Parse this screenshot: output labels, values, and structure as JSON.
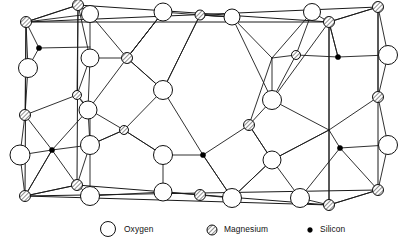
{
  "figure": {
    "background_color": "#ffffff",
    "line_color": "#1a1a1a"
  },
  "legend": {
    "items": [
      {
        "key": "oxygen",
        "label": "Oxygen",
        "symbol": "open-circle",
        "radius": 7.5,
        "fill": "#ffffff",
        "stroke": "#111111",
        "cx": 108,
        "cy": 229,
        "label_x": 124,
        "label_y": 232
      },
      {
        "key": "magnesium",
        "label": "Magnesium",
        "symbol": "hatched-circle",
        "radius": 5.0,
        "fill": "hatch",
        "stroke": "#111111",
        "cx": 212,
        "cy": 230,
        "label_x": 224,
        "label_y": 232
      },
      {
        "key": "silicon",
        "label": "Silicon",
        "symbol": "filled-dot",
        "radius": 2.4,
        "fill": "#000000",
        "stroke": "#000000",
        "cx": 310,
        "cy": 230,
        "label_x": 320,
        "label_y": 232
      }
    ]
  },
  "structure": {
    "cell_edges": [
      [
        26,
        22,
        78,
        5
      ],
      [
        78,
        5,
        329,
        22
      ],
      [
        329,
        22,
        378,
        7
      ],
      [
        26,
        22,
        25,
        196
      ],
      [
        78,
        5,
        77,
        185
      ],
      [
        329,
        22,
        329,
        205
      ],
      [
        378,
        7,
        378,
        190
      ],
      [
        25,
        196,
        77,
        185
      ],
      [
        77,
        185,
        329,
        205
      ],
      [
        329,
        205,
        378,
        190
      ],
      [
        26,
        22,
        378,
        7
      ],
      [
        25,
        196,
        378,
        190
      ],
      [
        26,
        22,
        329,
        22
      ],
      [
        25,
        196,
        329,
        205
      ]
    ],
    "bonds": [
      [
        26,
        22,
        90,
        14
      ],
      [
        78,
        5,
        90,
        14
      ],
      [
        26,
        22,
        78,
        5
      ],
      [
        90,
        14,
        127,
        58
      ],
      [
        90,
        14,
        90,
        58
      ],
      [
        26,
        22,
        39,
        48
      ],
      [
        39,
        48,
        90,
        47
      ],
      [
        39,
        48,
        28,
        68
      ],
      [
        28,
        68,
        26,
        22
      ],
      [
        28,
        68,
        25,
        115
      ],
      [
        26,
        22,
        25,
        115
      ],
      [
        25,
        115,
        52,
        150
      ],
      [
        52,
        150,
        25,
        196
      ],
      [
        25,
        115,
        20,
        155
      ],
      [
        20,
        155,
        25,
        196
      ],
      [
        77,
        95,
        25,
        115
      ],
      [
        77,
        95,
        88,
        110
      ],
      [
        78,
        5,
        77,
        95
      ],
      [
        77,
        95,
        90,
        58
      ],
      [
        90,
        58,
        127,
        58
      ],
      [
        90,
        58,
        88,
        110
      ],
      [
        88,
        110,
        127,
        58
      ],
      [
        88,
        110,
        90,
        145
      ],
      [
        127,
        58,
        163,
        12
      ],
      [
        127,
        58,
        163,
        90
      ],
      [
        163,
        12,
        200,
        15
      ],
      [
        163,
        12,
        127,
        58
      ],
      [
        200,
        15,
        232,
        17
      ],
      [
        200,
        15,
        163,
        90
      ],
      [
        232,
        17,
        272,
        58
      ],
      [
        232,
        17,
        200,
        15
      ],
      [
        272,
        58,
        312,
        12
      ],
      [
        272,
        58,
        296,
        55
      ],
      [
        296,
        55,
        312,
        12
      ],
      [
        296,
        55,
        338,
        57
      ],
      [
        312,
        12,
        329,
        22
      ],
      [
        329,
        22,
        338,
        57
      ],
      [
        338,
        57,
        388,
        55
      ],
      [
        388,
        55,
        378,
        7
      ],
      [
        388,
        55,
        378,
        97
      ],
      [
        329,
        22,
        378,
        7
      ],
      [
        163,
        90,
        200,
        15
      ],
      [
        163,
        90,
        127,
        58
      ],
      [
        163,
        90,
        203,
        155
      ],
      [
        163,
        90,
        124,
        130
      ],
      [
        272,
        58,
        272,
        100
      ],
      [
        272,
        100,
        329,
        22
      ],
      [
        272,
        100,
        249,
        125
      ],
      [
        249,
        125,
        272,
        58
      ],
      [
        272,
        100,
        329,
        130
      ],
      [
        329,
        130,
        378,
        97
      ],
      [
        329,
        130,
        329,
        22
      ],
      [
        378,
        97,
        378,
        7
      ],
      [
        90,
        145,
        124,
        130
      ],
      [
        124,
        130,
        90,
        110
      ],
      [
        90,
        145,
        77,
        185
      ],
      [
        90,
        145,
        90,
        196
      ],
      [
        124,
        130,
        163,
        155
      ],
      [
        163,
        155,
        203,
        155
      ],
      [
        203,
        155,
        249,
        125
      ],
      [
        203,
        155,
        232,
        198
      ],
      [
        249,
        125,
        272,
        160
      ],
      [
        272,
        160,
        249,
        125
      ],
      [
        272,
        160,
        300,
        198
      ],
      [
        272,
        160,
        329,
        130
      ],
      [
        329,
        130,
        329,
        205
      ],
      [
        329,
        130,
        272,
        160
      ],
      [
        90,
        196,
        77,
        185
      ],
      [
        77,
        185,
        25,
        196
      ],
      [
        90,
        196,
        163,
        192
      ],
      [
        163,
        192,
        200,
        195
      ],
      [
        200,
        195,
        232,
        198
      ],
      [
        232,
        198,
        272,
        160
      ],
      [
        300,
        198,
        329,
        205
      ],
      [
        329,
        205,
        378,
        190
      ],
      [
        378,
        190,
        388,
        145
      ],
      [
        388,
        145,
        378,
        97
      ],
      [
        388,
        145,
        340,
        148
      ],
      [
        340,
        148,
        329,
        130
      ],
      [
        52,
        150,
        90,
        145
      ],
      [
        52,
        150,
        88,
        110
      ],
      [
        20,
        155,
        52,
        150
      ],
      [
        127,
        58,
        163,
        12
      ],
      [
        90,
        58,
        78,
        5
      ],
      [
        232,
        17,
        272,
        100
      ],
      [
        200,
        15,
        232,
        17
      ],
      [
        163,
        155,
        124,
        130
      ],
      [
        163,
        155,
        163,
        192
      ],
      [
        90,
        145,
        124,
        130
      ],
      [
        203,
        155,
        232,
        198
      ],
      [
        272,
        160,
        232,
        198
      ],
      [
        340,
        148,
        378,
        190
      ],
      [
        340,
        148,
        300,
        198
      ],
      [
        296,
        55,
        272,
        100
      ],
      [
        338,
        57,
        329,
        22
      ],
      [
        52,
        150,
        77,
        185
      ],
      [
        25,
        196,
        52,
        150
      ],
      [
        90,
        110,
        77,
        95
      ],
      [
        90,
        110,
        90,
        145
      ]
    ],
    "atoms": {
      "oxygen": [
        {
          "cx": 90,
          "cy": 14,
          "r": 8.5
        },
        {
          "cx": 163,
          "cy": 12,
          "r": 9.0
        },
        {
          "cx": 232,
          "cy": 17,
          "r": 8.0
        },
        {
          "cx": 312,
          "cy": 12,
          "r": 8.5
        },
        {
          "cx": 90,
          "cy": 58,
          "r": 9.0
        },
        {
          "cx": 28,
          "cy": 68,
          "r": 9.5
        },
        {
          "cx": 88,
          "cy": 110,
          "r": 9.0
        },
        {
          "cx": 163,
          "cy": 90,
          "r": 9.5
        },
        {
          "cx": 272,
          "cy": 100,
          "r": 9.5
        },
        {
          "cx": 388,
          "cy": 55,
          "r": 9.5
        },
        {
          "cx": 20,
          "cy": 155,
          "r": 10.0
        },
        {
          "cx": 90,
          "cy": 145,
          "r": 9.5
        },
        {
          "cx": 124,
          "cy": 130,
          "r": 0.1
        },
        {
          "cx": 163,
          "cy": 155,
          "r": 9.5
        },
        {
          "cx": 272,
          "cy": 160,
          "r": 9.0
        },
        {
          "cx": 388,
          "cy": 145,
          "r": 9.5
        },
        {
          "cx": 90,
          "cy": 196,
          "r": 9.5
        },
        {
          "cx": 163,
          "cy": 192,
          "r": 9.0
        },
        {
          "cx": 232,
          "cy": 198,
          "r": 9.5
        },
        {
          "cx": 300,
          "cy": 198,
          "r": 9.5
        },
        {
          "cx": 249,
          "cy": 125,
          "r": 0.1
        }
      ],
      "magnesium": [
        {
          "cx": 26,
          "cy": 22,
          "r": 5.5
        },
        {
          "cx": 78,
          "cy": 5,
          "r": 5.5
        },
        {
          "cx": 329,
          "cy": 22,
          "r": 5.5
        },
        {
          "cx": 378,
          "cy": 7,
          "r": 5.5
        },
        {
          "cx": 200,
          "cy": 15,
          "r": 5.0
        },
        {
          "cx": 127,
          "cy": 58,
          "r": 5.5
        },
        {
          "cx": 296,
          "cy": 55,
          "r": 4.5
        },
        {
          "cx": 25,
          "cy": 115,
          "r": 5.5
        },
        {
          "cx": 77,
          "cy": 95,
          "r": 4.5
        },
        {
          "cx": 272,
          "cy": 58,
          "r": 0.1
        },
        {
          "cx": 378,
          "cy": 97,
          "r": 5.5
        },
        {
          "cx": 249,
          "cy": 125,
          "r": 5.5
        },
        {
          "cx": 124,
          "cy": 130,
          "r": 4.5
        },
        {
          "cx": 25,
          "cy": 196,
          "r": 5.5
        },
        {
          "cx": 77,
          "cy": 185,
          "r": 5.5
        },
        {
          "cx": 200,
          "cy": 195,
          "r": 5.5
        },
        {
          "cx": 329,
          "cy": 205,
          "r": 5.5
        },
        {
          "cx": 378,
          "cy": 190,
          "r": 5.5
        },
        {
          "cx": 329,
          "cy": 130,
          "r": 0.1
        }
      ],
      "silicon": [
        {
          "cx": 39,
          "cy": 48,
          "r": 2.6
        },
        {
          "cx": 338,
          "cy": 57,
          "r": 2.6
        },
        {
          "cx": 52,
          "cy": 150,
          "r": 2.6
        },
        {
          "cx": 203,
          "cy": 155,
          "r": 2.6
        },
        {
          "cx": 340,
          "cy": 148,
          "r": 2.6
        }
      ]
    }
  }
}
